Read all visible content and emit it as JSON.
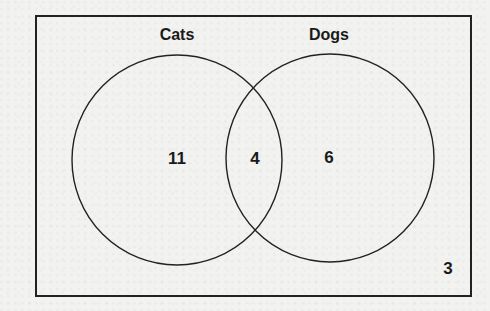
{
  "diagram": {
    "type": "venn",
    "universe": {
      "outside_count": "3"
    },
    "sets": [
      {
        "label": "Cats",
        "only_count": "11"
      },
      {
        "label": "Dogs",
        "only_count": "6"
      }
    ],
    "intersection_count": "4",
    "colors": {
      "stroke": "#222222",
      "background": "#f2f2f0",
      "text": "#1a1a1a"
    }
  }
}
